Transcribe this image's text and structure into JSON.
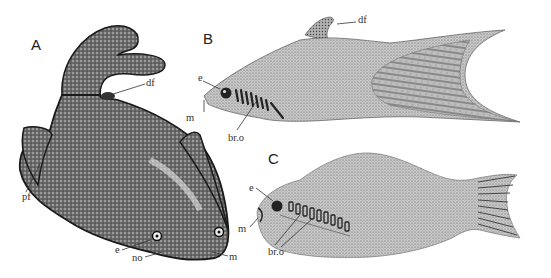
{
  "figure": {
    "panels": [
      {
        "id": "A",
        "letter": "A",
        "labels": {
          "df": "df",
          "pf": "pf",
          "e": "e",
          "no": "no",
          "m": "m"
        }
      },
      {
        "id": "B",
        "letter": "B",
        "labels": {
          "df": "df",
          "e": "e",
          "m": "m",
          "bro": "br.o"
        }
      },
      {
        "id": "C",
        "letter": "C",
        "labels": {
          "e": "e",
          "m": "m",
          "bro": "br.o"
        }
      }
    ]
  }
}
